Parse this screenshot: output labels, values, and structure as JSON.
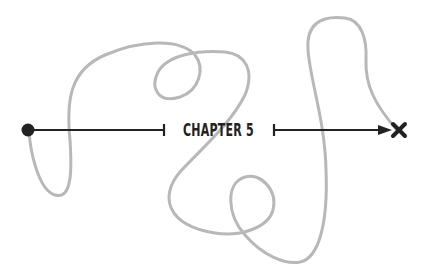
{
  "diagram": {
    "label": "CHAPTER 5",
    "start_marker": "filled-circle",
    "end_marker": "x-mark",
    "colors": {
      "path": "#b8b8b8",
      "line": "#222222",
      "background": "#ffffff"
    }
  }
}
